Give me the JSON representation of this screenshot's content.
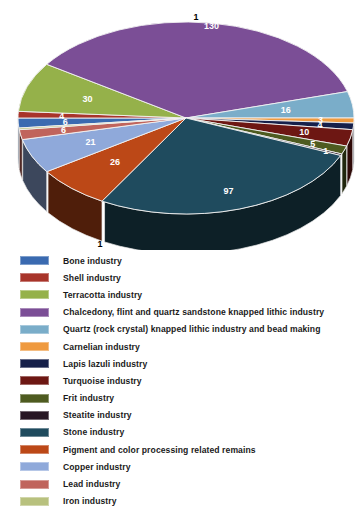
{
  "chart_data": {
    "type": "pie",
    "title": "",
    "subtitle": "",
    "xlabel": "",
    "ylabel": "",
    "legend_position": "bottom",
    "three_d": true,
    "categories": [
      "Bone industry",
      "Shell industry",
      "Terracotta industry",
      "Chalcedony, flint and quartz sandstone knapped lithic industry",
      "Quartz (rock crystal) knapped lithic industry and bead making",
      "Carnelian industry",
      "Lapis lazuli industry",
      "Turquoise industry",
      "Frit industry",
      "Steatite industry",
      "Stone industry",
      "Pigment and color processing related remains",
      "Copper industry",
      "Lead industry",
      "Iron industry"
    ],
    "values": [
      6,
      4,
      30,
      130,
      16,
      3,
      4,
      10,
      5,
      1,
      97,
      26,
      21,
      6,
      1
    ],
    "colors": [
      "#3a6ab0",
      "#a8342a",
      "#95b14a",
      "#7b4e96",
      "#7aadc9",
      "#ef9a3f",
      "#16204a",
      "#6d1713",
      "#4e5b20",
      "#271623",
      "#1f4b5e",
      "#bc4817",
      "#8fa9da",
      "#c0645c",
      "#b8c17e"
    ],
    "visible_slice_labels": [
      {
        "value": "1",
        "category": "Lead industry"
      },
      {
        "value": "6",
        "category": "Lead industry"
      },
      {
        "value": "6",
        "category": "Bone industry"
      },
      {
        "value": "4",
        "category": "Shell industry"
      },
      {
        "value": "30",
        "category": "Terracotta industry"
      },
      {
        "value": "1",
        "category": "Chalcedony, flint and quartz sandstone knapped lithic industry"
      },
      {
        "value": "16",
        "category": "Quartz (rock crystal) knapped lithic industry and bead making"
      },
      {
        "value": "3",
        "category": "Carnelian industry"
      },
      {
        "value": "4",
        "category": "Lapis lazuli industry"
      },
      {
        "value": "10",
        "category": "Turquoise industry"
      },
      {
        "value": "5",
        "category": "Frit industry"
      },
      {
        "value": "1",
        "category": "Iron industry"
      },
      {
        "value": "97",
        "category": "Stone industry"
      },
      {
        "value": "26",
        "category": "Pigment and color processing related remains"
      },
      {
        "value": "21",
        "category": "Copper industry"
      }
    ]
  },
  "labels": {
    "lead_top": "1",
    "shell_top": "6",
    "bone": "6",
    "shell2": "4",
    "terracotta": "30",
    "chalcedony_clipped": "1",
    "quartz": "16",
    "carnelian": "3",
    "lapis": "4",
    "turquoise": "10",
    "frit": "5",
    "iron_bottom": "1",
    "stone": "97",
    "pigment": "26",
    "copper": "21"
  },
  "legend": {
    "items": [
      {
        "label": "Bone industry",
        "color": "#3a6ab0"
      },
      {
        "label": "Shell industry",
        "color": "#a8342a"
      },
      {
        "label": "Terracotta industry",
        "color": "#95b14a"
      },
      {
        "label": "Chalcedony, flint and quartz sandstone knapped lithic industry",
        "color": "#7b4e96"
      },
      {
        "label": "Quartz (rock crystal) knapped lithic industry and bead making",
        "color": "#7aadc9"
      },
      {
        "label": "Carnelian industry",
        "color": "#ef9a3f"
      },
      {
        "label": "Lapis lazuli industry",
        "color": "#16204a"
      },
      {
        "label": "Turquoise industry",
        "color": "#6d1713"
      },
      {
        "label": "Frit industry",
        "color": "#4e5b20"
      },
      {
        "label": "Steatite industry",
        "color": "#271623"
      },
      {
        "label": "Stone industry",
        "color": "#1f4b5e"
      },
      {
        "label": "Pigment and color processing related remains",
        "color": "#bc4817"
      },
      {
        "label": "Copper industry",
        "color": "#8fa9da"
      },
      {
        "label": "Lead industry",
        "color": "#c0645c"
      },
      {
        "label": "Iron industry",
        "color": "#b8c17e"
      }
    ]
  }
}
